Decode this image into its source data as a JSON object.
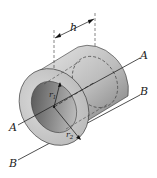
{
  "figure": {
    "labels": {
      "height": "h",
      "inner_radius": "r",
      "inner_radius_sub": "1",
      "outer_radius": "r",
      "outer_radius_sub": "2",
      "axis_a_right": "A",
      "axis_a_left": "A",
      "axis_b_right": "B",
      "axis_b_left": "B"
    },
    "colors": {
      "body_light": "#d9d9d9",
      "body_dark": "#8a8a8a",
      "face": "#c8c8c8",
      "hole_dark": "#5a5a5a",
      "line": "#222222"
    }
  }
}
